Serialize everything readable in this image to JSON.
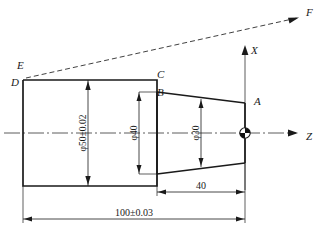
{
  "drawing": {
    "type": "engineering-part-drawing",
    "description": "Turned shaft profile with cylindrical section and tapered cone section, CNC coordinate system",
    "background_color": "#ffffff",
    "line_color": "#1a1a1a",
    "point_labels": [
      {
        "id": "A",
        "text": "A",
        "x": 254,
        "y": 105
      },
      {
        "id": "B",
        "text": "B",
        "x": 157,
        "y": 96
      },
      {
        "id": "C",
        "text": "C",
        "x": 157,
        "y": 78
      },
      {
        "id": "D",
        "text": "D",
        "x": 11,
        "y": 86
      },
      {
        "id": "E",
        "text": "E",
        "x": 17,
        "y": 69
      },
      {
        "id": "F",
        "text": "F",
        "x": 306,
        "y": 16
      }
    ],
    "axis_labels": [
      {
        "id": "X",
        "text": "X",
        "x": 251,
        "y": 54
      },
      {
        "id": "Z",
        "text": "Z",
        "x": 306,
        "y": 140
      }
    ],
    "dimensions": {
      "diameter_50": "φ50±0.02",
      "diameter_40": "φ40",
      "diameter_30": "φ30",
      "length_40": "40",
      "length_100": "100±0.03"
    },
    "origin_marker": {
      "name": "workpiece-origin",
      "x": 245,
      "y": 133,
      "radius": 5
    }
  }
}
